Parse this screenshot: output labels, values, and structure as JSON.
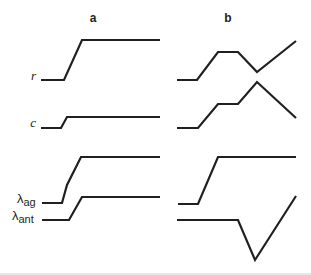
{
  "figure": {
    "panels": [
      {
        "id": "a",
        "label": "a"
      },
      {
        "id": "b",
        "label": "b"
      }
    ],
    "rows": [
      {
        "id": "r",
        "label": "r"
      },
      {
        "id": "c",
        "label": "c"
      },
      {
        "id": "lambda_ag",
        "label_symbol": "λ",
        "label_sub": "ag"
      },
      {
        "id": "lambda_ant",
        "label_symbol": "λ",
        "label_sub": "ant"
      }
    ],
    "curves": {
      "a_r": "41,80 64,80 82,40 160,40",
      "a_c": "41,128 61,128 67,117 160,117",
      "a_lambda_ag": "42,203 62,203 67,185 81,157 160,157",
      "a_lambda_ant": "42,220 69,220 82,197 160,197",
      "b_r": "177,80 197,80 218,52 238,52 257,72 296,41",
      "b_c": "177,128 198,128 218,104 238,104 257,82 296,118",
      "b_lambda_ag": "178,204 198,204 218,157 296,157",
      "b_lambda_ant": "177,220 238,220 255,260 296,196"
    },
    "colors": {
      "line": "#231f20",
      "background": "#ffffff",
      "rule": "#cfcfcf"
    }
  }
}
